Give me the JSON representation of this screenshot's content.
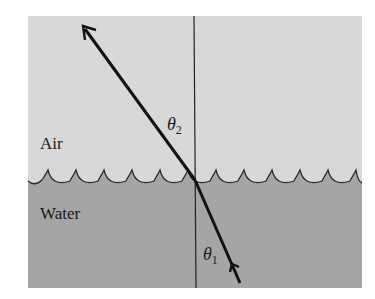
{
  "diagram": {
    "colors": {
      "background": "#ffffff",
      "air": "#d8d8d8",
      "water": "#a5a5a5",
      "line": "#111111",
      "surface": "#2a2a2a"
    },
    "regions": {
      "air": {
        "label": "Air"
      },
      "water": {
        "label": "Water"
      }
    },
    "angles": {
      "refracted": {
        "symbol": "θ",
        "subscript": "2"
      },
      "incident": {
        "symbol": "θ",
        "subscript": "1"
      }
    },
    "elements": [
      "normal-line",
      "incident-ray",
      "refracted-ray",
      "water-surface"
    ]
  }
}
